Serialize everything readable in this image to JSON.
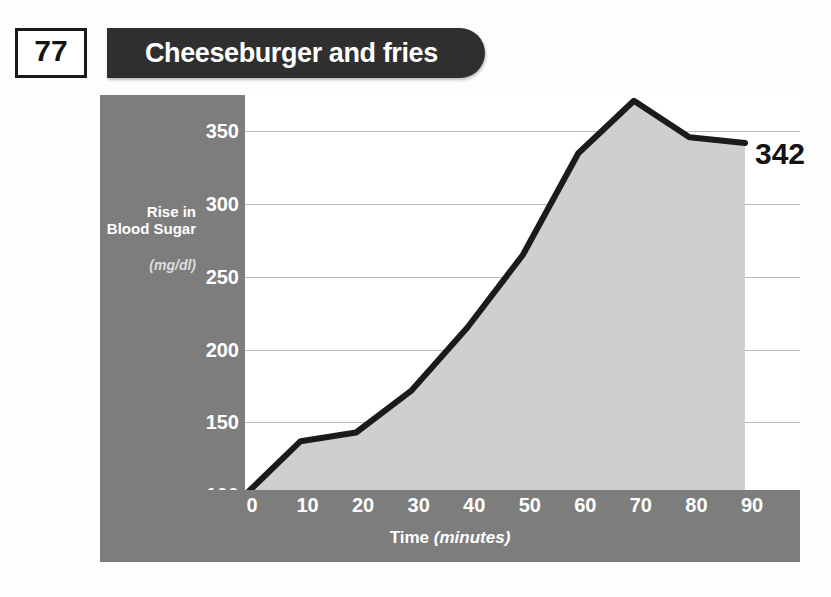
{
  "header": {
    "number": "77",
    "title": "Cheeseburger and fries"
  },
  "annotation": {
    "end_value": "342"
  },
  "axis": {
    "y_title": "Rise in Blood Sugar",
    "y_units": "(mg/dl)",
    "x_title": "Time ",
    "x_units": "(minutes)"
  },
  "colors": {
    "panel_gray": "#7d7d7d",
    "banner_dark": "#2f2f2f",
    "fill_gray": "#cfcfcf",
    "line_black": "#1b1b1b",
    "gridline": "#b9b9b9"
  },
  "chart_data": {
    "type": "area",
    "title": "Cheeseburger and fries",
    "xlabel": "Time (minutes)",
    "ylabel": "Rise in Blood Sugar (mg/dl)",
    "xlim": [
      0,
      90
    ],
    "ylim": [
      100,
      375
    ],
    "grid": true,
    "legend": false,
    "x_ticks": [
      0,
      10,
      20,
      30,
      40,
      50,
      60,
      70,
      80,
      90
    ],
    "y_ticks": [
      100,
      150,
      200,
      250,
      300,
      350
    ],
    "x": [
      0,
      10,
      20,
      30,
      40,
      50,
      60,
      70,
      80,
      90
    ],
    "values": [
      100,
      137,
      143,
      172,
      215,
      265,
      335,
      371,
      346,
      342
    ],
    "annotations": [
      {
        "text": "342",
        "x": 90,
        "y": 342
      }
    ]
  }
}
